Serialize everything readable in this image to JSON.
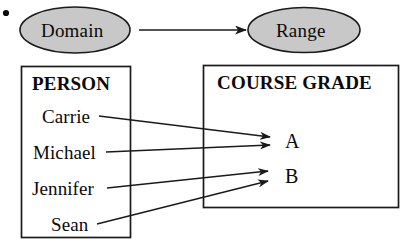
{
  "figure": {
    "bullet": "•",
    "top_diagram": {
      "domain_node": {
        "label": "Domain",
        "shape": "ellipse",
        "fill": "#c8c8c8",
        "stroke": "#1a1a1a"
      },
      "range_node": {
        "label": "Range",
        "shape": "ellipse",
        "fill": "#c8c8c8",
        "stroke": "#1a1a1a"
      },
      "connector": {
        "name": "domain-to-range-arrow",
        "style": "straight-arrow",
        "color": "#1a1a1a"
      }
    },
    "person_set": {
      "title": "PERSON",
      "members": [
        {
          "label": "Carrie"
        },
        {
          "label": "Michael"
        },
        {
          "label": "Jennifer"
        },
        {
          "label": "Sean"
        }
      ]
    },
    "grade_set": {
      "title": "COURSE GRADE",
      "members": [
        {
          "label": "A"
        },
        {
          "label": "B"
        }
      ]
    },
    "mappings": [
      {
        "from": "Carrie",
        "to": "A"
      },
      {
        "from": "Michael",
        "to": "A"
      },
      {
        "from": "Jennifer",
        "to": "B"
      },
      {
        "from": "Sean",
        "to": "B"
      }
    ],
    "colors": {
      "ink": "#0a0a0a",
      "line": "#1a1a1a",
      "ellipse_fill": "#c8c8c8",
      "background": "#ffffff"
    }
  }
}
